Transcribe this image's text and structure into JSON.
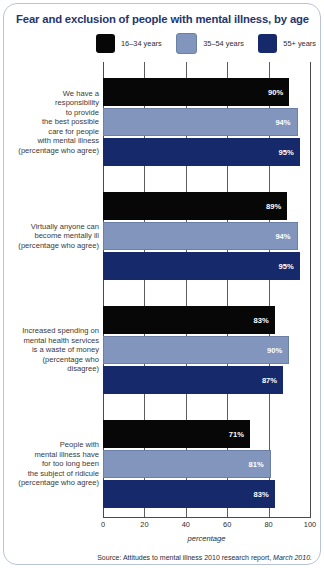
{
  "title": "Fear and exclusion of people with mental illness, by age",
  "source": "Source: Attitudes to mental illness 2010 research report, March 2010.",
  "colors": {
    "title": "#25356e",
    "series_16_34": "#070707",
    "series_35_54": "#8296bd",
    "series_55_plus": "#16296b",
    "frame": "#b9c3d8"
  },
  "legend": [
    {
      "label": "16–34 years",
      "color": "#070707"
    },
    {
      "label": "35–54 years",
      "color": "#8296bd"
    },
    {
      "label": "55+ years",
      "color": "#16296b"
    }
  ],
  "chart_data": {
    "type": "bar",
    "orientation": "horizontal",
    "title": "Fear and exclusion of people with mental illness, by age",
    "xlabel": "percentage",
    "ylabel": "",
    "xlim": [
      0,
      100
    ],
    "xticks": [
      0,
      20,
      40,
      60,
      80,
      100
    ],
    "grid": true,
    "legend_position": "top",
    "categories": [
      "We have a responsibility to provide the best possible care for people with mental illness (percentage who agree)",
      "Virtually anyone can become mentally ill (percentage who agree)",
      "Increased spending on mental health services is a waste of money (percentage who disagree)",
      "People with mental illness have for too long been the subject of ridicule (percentage who agree)"
    ],
    "category_lines": [
      [
        "We have a",
        "responsibility",
        "to provide",
        "the best possible",
        "care for people",
        "with mental illness",
        "(percentage who agree)"
      ],
      [
        "Virtually anyone can",
        "become mentally ill",
        "(percentage who agree)"
      ],
      [
        "Increased spending on",
        "mental health services",
        "is a waste of money",
        "(percentage who",
        "disagree)"
      ],
      [
        "People with",
        "mental illness have",
        "for too long been",
        "the subject of ridicule",
        "(percentage who agree)"
      ]
    ],
    "series": [
      {
        "name": "16–34 years",
        "color": "#070707",
        "values": [
          90,
          89,
          83,
          71
        ],
        "labels": [
          "90%",
          "89%",
          "83%",
          "71%"
        ]
      },
      {
        "name": "35–54 years",
        "color": "#8296bd",
        "values": [
          94,
          94,
          90,
          81
        ],
        "labels": [
          "94%",
          "94%",
          "90%",
          "81%"
        ]
      },
      {
        "name": "55+ years",
        "color": "#16296b",
        "values": [
          95,
          95,
          87,
          83
        ],
        "labels": [
          "95%",
          "95%",
          "87%",
          "83%"
        ]
      }
    ]
  }
}
